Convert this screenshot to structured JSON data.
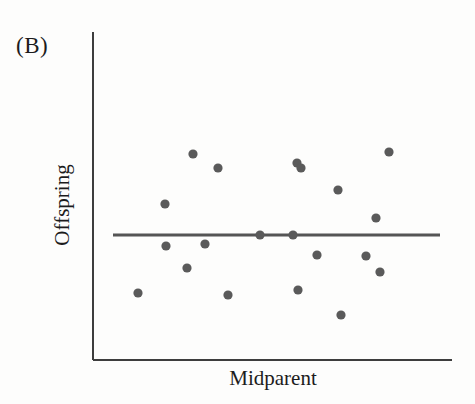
{
  "figure": {
    "panel_label": "(B)",
    "background_color": "#fdfdfc"
  },
  "axes": {
    "y_label": "Offspring",
    "x_label": "Midparent",
    "axis_color": "#3d3d3d",
    "axis_line_width": 2,
    "origin_x": 93,
    "origin_y": 360,
    "x_axis_end": 452,
    "y_axis_top": 32
  },
  "chart_data": {
    "type": "scatter",
    "title": "(B)",
    "xlabel": "Midparent",
    "ylabel": "Offspring",
    "grid": false,
    "legend": false,
    "axis_ticks": [],
    "marker_color": "#5a5a5a",
    "marker_radius": 4.6,
    "xlim": [
      93,
      452
    ],
    "ylim": [
      32,
      360
    ],
    "points": [
      {
        "x": 193,
        "y": 154
      },
      {
        "x": 218,
        "y": 168
      },
      {
        "x": 165,
        "y": 204
      },
      {
        "x": 166,
        "y": 246
      },
      {
        "x": 205,
        "y": 244
      },
      {
        "x": 187,
        "y": 268
      },
      {
        "x": 138,
        "y": 293
      },
      {
        "x": 228,
        "y": 295
      },
      {
        "x": 297,
        "y": 163
      },
      {
        "x": 301,
        "y": 168
      },
      {
        "x": 260,
        "y": 235
      },
      {
        "x": 293,
        "y": 235
      },
      {
        "x": 317,
        "y": 255
      },
      {
        "x": 298,
        "y": 290
      },
      {
        "x": 341,
        "y": 315
      },
      {
        "x": 389,
        "y": 152
      },
      {
        "x": 338,
        "y": 190
      },
      {
        "x": 376,
        "y": 218
      },
      {
        "x": 366,
        "y": 256
      },
      {
        "x": 380,
        "y": 272
      }
    ],
    "regression_line": {
      "label": "regression-line",
      "color": "#555555",
      "width": 3,
      "slope": 0,
      "x_start": 113,
      "x_end": 440,
      "y_start": 235,
      "y_end": 235
    }
  }
}
